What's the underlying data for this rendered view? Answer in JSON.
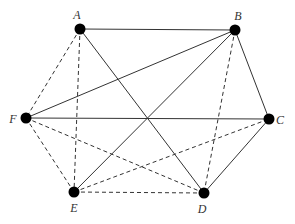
{
  "graph": {
    "nodes": [
      {
        "id": "A",
        "label": "A",
        "x": 80,
        "y": 29,
        "lx": 77,
        "ly": 19
      },
      {
        "id": "B",
        "label": "B",
        "x": 235,
        "y": 30,
        "lx": 238,
        "ly": 20
      },
      {
        "id": "C",
        "label": "C",
        "x": 269,
        "y": 119,
        "lx": 280,
        "ly": 124
      },
      {
        "id": "D",
        "label": "D",
        "x": 204,
        "y": 193,
        "lx": 202,
        "ly": 213
      },
      {
        "id": "E",
        "label": "E",
        "x": 74,
        "y": 192,
        "lx": 74,
        "ly": 212
      },
      {
        "id": "F",
        "label": "F",
        "x": 26,
        "y": 118,
        "lx": 13,
        "ly": 123
      }
    ],
    "edges": [
      {
        "from": "A",
        "to": "B",
        "style": "solid"
      },
      {
        "from": "A",
        "to": "D",
        "style": "solid"
      },
      {
        "from": "B",
        "to": "F",
        "style": "solid"
      },
      {
        "from": "B",
        "to": "E",
        "style": "solid"
      },
      {
        "from": "B",
        "to": "C",
        "style": "solid"
      },
      {
        "from": "F",
        "to": "C",
        "style": "solid"
      },
      {
        "from": "C",
        "to": "D",
        "style": "solid"
      },
      {
        "from": "A",
        "to": "F",
        "style": "dashed"
      },
      {
        "from": "A",
        "to": "E",
        "style": "dashed"
      },
      {
        "from": "B",
        "to": "D",
        "style": "dashed"
      },
      {
        "from": "F",
        "to": "E",
        "style": "dashed"
      },
      {
        "from": "F",
        "to": "D",
        "style": "dashed"
      },
      {
        "from": "E",
        "to": "C",
        "style": "dashed"
      },
      {
        "from": "E",
        "to": "D",
        "style": "dashed"
      }
    ]
  },
  "colors": {
    "edge": "#333333",
    "node": "#000000"
  }
}
